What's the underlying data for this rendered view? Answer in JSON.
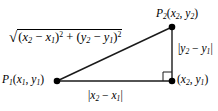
{
  "diagram": {
    "type": "right-triangle-distance-formula",
    "background_color": "#ffffff",
    "line_color": "#1a1a1a",
    "text_color": "#000000",
    "width": 218,
    "height": 111,
    "vertices": {
      "p1": {
        "x": 57,
        "y": 81
      },
      "p2": {
        "x": 172,
        "y": 27
      },
      "corner": {
        "x": 172,
        "y": 81
      }
    },
    "labels": {
      "distance_formula": {
        "radical_sign": "√",
        "term1_open": "(",
        "term1_var_a": "x",
        "term1_sub_a": "2",
        "term1_minus": " − ",
        "term1_var_b": "x",
        "term1_sub_b": "1",
        "term1_close": ")",
        "term1_exp": "2",
        "plus": " + ",
        "term2_open": "(",
        "term2_var_a": "y",
        "term2_sub_a": "2",
        "term2_minus": " − ",
        "term2_var_b": "y",
        "term2_sub_b": "1",
        "term2_close": ")",
        "term2_exp": "2",
        "plain_text": "√((x2 − x1)² + (y2 − y1)²)"
      },
      "point_p2": {
        "name": "P",
        "name_sub": "2",
        "open": "(",
        "var_x": "x",
        "sub_x": "2",
        "comma": ", ",
        "var_y": "y",
        "sub_y": "2",
        "close": ")",
        "plain_text": "P2(x2, y2)"
      },
      "point_p1": {
        "name": "P",
        "name_sub": "1",
        "open": "(",
        "var_x": "x",
        "sub_x": "1",
        "comma": ", ",
        "var_y": "y",
        "sub_y": "1",
        "close": ")",
        "plain_text": "P1(x1, y1)"
      },
      "point_corner": {
        "open": "(",
        "var_x": "x",
        "sub_x": "2",
        "comma": ", ",
        "var_y": "y",
        "sub_y": "1",
        "close": ")",
        "plain_text": "(x2, y1)"
      },
      "vertical_leg": {
        "bar_open": "|",
        "var_a": "y",
        "sub_a": "2",
        "minus": " − ",
        "var_b": "y",
        "sub_b": "1",
        "bar_close": "|",
        "plain_text": "|y2 − y1|"
      },
      "horizontal_leg": {
        "bar_open": "|",
        "var_a": "x",
        "sub_a": "2",
        "minus": " − ",
        "var_b": "x",
        "sub_b": "1",
        "bar_close": "|",
        "plain_text": "|x2 − x1|"
      }
    }
  }
}
